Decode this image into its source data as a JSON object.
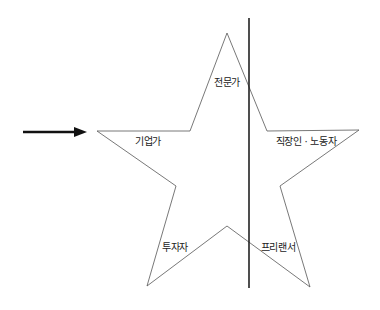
{
  "diagram": {
    "type": "star-diagram",
    "colors": {
      "star_stroke": "#555555",
      "divider_line": "#222222",
      "arrow": "#111111",
      "text": "#222222",
      "background": "#ffffff"
    },
    "labels": {
      "top": "전문가",
      "left": "기업가",
      "right": "직장인 · 노동자",
      "bottom_left": "투자자",
      "bottom_right": "프리랜서"
    },
    "arrow": {
      "direction": "right"
    },
    "divider": {
      "orientation": "vertical"
    }
  }
}
